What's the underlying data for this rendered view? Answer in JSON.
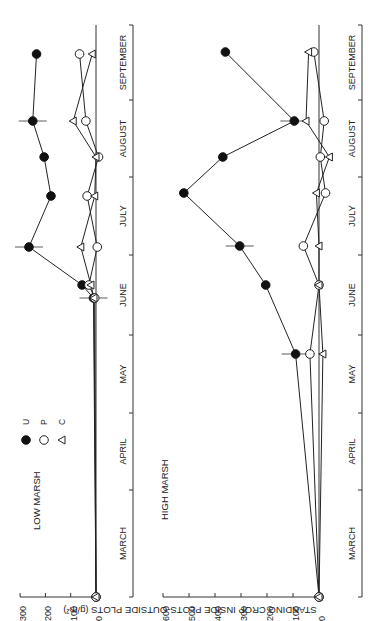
{
  "chart_data": [
    {
      "type": "line",
      "title": "LOW MARSH",
      "xlabel": "",
      "ylabel": "STANDING CROP INSIDE PLOTS-OUTSIDE PLOTS (g/m²)",
      "ylim": [
        0,
        300
      ],
      "yticks": [
        0,
        100,
        200,
        300
      ],
      "months": [
        "MARCH",
        "APRIL",
        "MAY",
        "JUNE",
        "JULY",
        "AUGUST",
        "SEPTEMBER"
      ],
      "x_positions_px": [
        597,
        298,
        285,
        247,
        196,
        157,
        121,
        54
      ],
      "legend": [
        {
          "symbol": "filled-circle",
          "label": "U"
        },
        {
          "symbol": "open-circle",
          "label": "P"
        },
        {
          "symbol": "open-triangle",
          "label": "C"
        }
      ],
      "series": [
        {
          "name": "U",
          "values": [
            0,
            10,
            55,
            265,
            178,
            205,
            250,
            235
          ]
        },
        {
          "name": "P",
          "values": [
            0,
            5,
            28,
            -5,
            35,
            -10,
            40,
            65
          ]
        },
        {
          "name": "C",
          "values": [
            0,
            8,
            20,
            60,
            5,
            0,
            90,
            15
          ]
        }
      ]
    },
    {
      "type": "line",
      "title": "HIGH MARSH",
      "xlabel": "",
      "ylabel": "STANDING CROP INSIDE PLOTS-OUTSIDE PLOTS (g/m²)",
      "ylim": [
        0,
        600
      ],
      "yticks": [
        0,
        100,
        200,
        300,
        400,
        500,
        600
      ],
      "months": [
        "MARCH",
        "APRIL",
        "MAY",
        "JUNE",
        "JULY",
        "AUGUST",
        "SEPTEMBER"
      ],
      "x_positions_px": [
        597,
        354,
        285,
        246,
        193,
        157,
        121,
        52
      ],
      "series": [
        {
          "name": "U",
          "values": [
            0,
            90,
            205,
            305,
            520,
            370,
            95,
            360
          ]
        },
        {
          "name": "P",
          "values": [
            0,
            35,
            0,
            60,
            -25,
            -5,
            -20,
            20
          ]
        },
        {
          "name": "C",
          "values": [
            0,
            -15,
            0,
            0,
            10,
            -40,
            50,
            40
          ]
        }
      ]
    }
  ],
  "labels": {
    "panel1_title": "LOW MARSH",
    "panel2_title": "HIGH MARSH",
    "ylabel": "STANDING CROP INSIDE PLOTS-OUTSIDE PLOTS (g/m²)",
    "legend_u": "U",
    "legend_p": "P",
    "legend_c": "C"
  }
}
